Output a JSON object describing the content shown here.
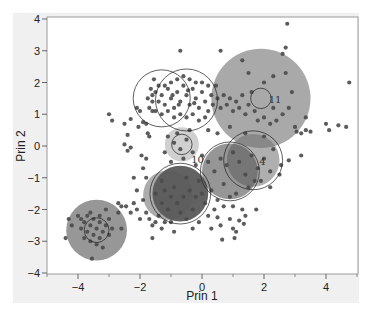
{
  "chart_data": {
    "type": "scatter",
    "title": "",
    "xlabel": "Prin 1",
    "ylabel": "Prin 2",
    "xlim": [
      -5,
      5.03
    ],
    "ylim": [
      -4,
      4.1
    ],
    "xticks": [
      -4,
      -2,
      0,
      2,
      4
    ],
    "yticks": [
      -4,
      -3,
      -2,
      -1,
      0,
      1,
      2,
      3,
      4
    ],
    "xminor": [
      -5,
      -3,
      -1,
      1,
      3,
      5
    ],
    "grid": false,
    "legend": null,
    "colors": {
      "background": "#ffffff",
      "panel": "#f0f0f0",
      "frame": "#9a9a9a",
      "point": "#4a4a4a",
      "shade_light": "#a8a8a8",
      "shade_mid": "#7a7a7a",
      "shade_dark": "#3c3c3c",
      "circle": "#222222"
    },
    "clusters": [
      {
        "id": "11",
        "cx": 1.9,
        "cy": 1.5,
        "shade_r": 1.6,
        "shade": "#9a9a9a",
        "shade_opacity": 0.85,
        "circle_r": 0.33,
        "label": "11",
        "label_dx": 0.25,
        "label_dy": -0.05
      },
      {
        "id": "A",
        "cx": -1.3,
        "cy": 1.5,
        "shade_r": 0.0,
        "shade": "#555555",
        "shade_opacity": 0.0,
        "circle_r": 0.92,
        "label": ""
      },
      {
        "id": "B",
        "cx": -0.5,
        "cy": 1.45,
        "shade_r": 0.0,
        "shade": "#555555",
        "shade_opacity": 0.0,
        "circle_r": 1.0,
        "label": ""
      },
      {
        "id": "C",
        "cx": -0.65,
        "cy": 0.05,
        "shade_r": 0.55,
        "shade": "#b0b0b0",
        "shade_opacity": 0.6,
        "circle_r": 0.33,
        "label": "10",
        "label_dx": 0.3,
        "label_dy": -0.5
      },
      {
        "id": "D",
        "cx": 1.65,
        "cy": -0.45,
        "shade_r": 0.85,
        "shade": "#6e6e6e",
        "shade_opacity": 0.55,
        "circle_r": 0.95,
        "label": "4",
        "label_dx": 0.2,
        "label_dy": -0.05
      },
      {
        "id": "E",
        "cx": 0.9,
        "cy": -0.8,
        "shade_r": 0.9,
        "shade": "#505050",
        "shade_opacity": 0.6,
        "circle_r": 0.95,
        "label": ""
      },
      {
        "id": "F",
        "cx": -0.7,
        "cy": -1.5,
        "shade_r": 0.9,
        "shade": "#2e2e2e",
        "shade_opacity": 0.75,
        "circle_r": 0.98,
        "label": ""
      },
      {
        "id": "G",
        "cx": -1.1,
        "cy": -1.55,
        "shade_r": 0.8,
        "shade": "#5a5a5a",
        "shade_opacity": 0.5,
        "circle_r": 0.0,
        "label": ""
      },
      {
        "id": "H",
        "cx": -3.4,
        "cy": -2.65,
        "shade_r": 0.98,
        "shade": "#8c8c8c",
        "shade_opacity": 0.9,
        "circle_r": 0.4,
        "label": ""
      }
    ],
    "points": [
      [
        -3.9,
        -2.3
      ],
      [
        -3.8,
        -2.4
      ],
      [
        -3.7,
        -2.2
      ],
      [
        -3.6,
        -2.5
      ],
      [
        -3.5,
        -2.3
      ],
      [
        -3.4,
        -2.6
      ],
      [
        -3.3,
        -2.4
      ],
      [
        -3.2,
        -2.7
      ],
      [
        -3.1,
        -2.5
      ],
      [
        -3.0,
        -2.3
      ],
      [
        -3.5,
        -2.8
      ],
      [
        -3.6,
        -3.0
      ],
      [
        -3.3,
        -2.9
      ],
      [
        -3.4,
        -3.1
      ],
      [
        -3.2,
        -3.2
      ],
      [
        -3.7,
        -2.7
      ],
      [
        -3.9,
        -2.6
      ],
      [
        -4.0,
        -2.2
      ],
      [
        -4.3,
        -2.3
      ],
      [
        -4.2,
        -2.5
      ],
      [
        -4.4,
        -2.9
      ],
      [
        -3.55,
        -3.55
      ],
      [
        -3.1,
        -2.0
      ],
      [
        -2.9,
        -2.6
      ],
      [
        -2.6,
        -2.6
      ],
      [
        -2.7,
        -2.1
      ],
      [
        -3.8,
        -2.9
      ],
      [
        -3.0,
        -2.8
      ],
      [
        -3.3,
        -2.2
      ],
      [
        -3.6,
        -2.1
      ],
      [
        -2.7,
        -1.8
      ],
      [
        -2.6,
        -1.9
      ],
      [
        -2.45,
        -1.9
      ],
      [
        -2.3,
        -2.1
      ],
      [
        -2.2,
        -1.8
      ],
      [
        -2.1,
        -2.0
      ],
      [
        -2.0,
        -2.3
      ],
      [
        -1.9,
        -1.7
      ],
      [
        -1.8,
        -2.1
      ],
      [
        -1.7,
        -2.3
      ],
      [
        -1.6,
        -2.5
      ],
      [
        -1.5,
        -2.4
      ],
      [
        -1.4,
        -2.2
      ],
      [
        -1.3,
        -2.6
      ],
      [
        -1.2,
        -2.4
      ],
      [
        -1.0,
        -2.4
      ],
      [
        -0.9,
        -2.7
      ],
      [
        -1.6,
        -2.9
      ],
      [
        -2.1,
        -1.4
      ],
      [
        -2.2,
        -1.0
      ],
      [
        -3.0,
        1.0
      ],
      [
        -2.9,
        0.8
      ],
      [
        -2.5,
        0.7
      ],
      [
        -2.3,
        0.85
      ],
      [
        -2.4,
        0.35
      ],
      [
        -2.5,
        0.05
      ],
      [
        -2.4,
        -0.15
      ],
      [
        -2.3,
        -0.05
      ],
      [
        -2.1,
        1.2
      ],
      [
        -2.0,
        1.1
      ],
      [
        -1.9,
        0.75
      ],
      [
        -1.8,
        0.7
      ],
      [
        -1.75,
        0.4
      ],
      [
        -1.7,
        0.3
      ],
      [
        -1.8,
        -0.4
      ],
      [
        -1.9,
        -0.7
      ],
      [
        -1.8,
        -1.0
      ],
      [
        -1.95,
        -0.3
      ],
      [
        -2.05,
        0.6
      ],
      [
        -1.6,
        1.1
      ],
      [
        -1.6,
        1.4
      ],
      [
        -1.5,
        1.7
      ],
      [
        -1.4,
        1.9
      ],
      [
        -1.3,
        1.6
      ],
      [
        -1.2,
        1.3
      ],
      [
        -1.1,
        1.8
      ],
      [
        -1.0,
        1.5
      ],
      [
        -0.9,
        1.2
      ],
      [
        -0.8,
        1.7
      ],
      [
        -0.7,
        1.4
      ],
      [
        -0.6,
        1.9
      ],
      [
        -0.5,
        1.6
      ],
      [
        -0.4,
        1.3
      ],
      [
        -0.3,
        1.8
      ],
      [
        -0.2,
        1.5
      ],
      [
        -0.1,
        1.2
      ],
      [
        0.0,
        1.7
      ],
      [
        0.1,
        1.4
      ],
      [
        0.2,
        1.1
      ],
      [
        0.3,
        1.6
      ],
      [
        -1.7,
        1.2
      ],
      [
        -1.5,
        1.1
      ],
      [
        -1.3,
        1.0
      ],
      [
        -1.1,
        1.1
      ],
      [
        -0.9,
        0.9
      ],
      [
        -0.7,
        1.0
      ],
      [
        -0.5,
        0.9
      ],
      [
        -0.3,
        1.0
      ],
      [
        -0.1,
        0.8
      ],
      [
        0.1,
        0.9
      ],
      [
        -1.6,
        1.6
      ],
      [
        -1.4,
        1.4
      ],
      [
        -1.2,
        1.9
      ],
      [
        -1.0,
        2.0
      ],
      [
        -0.8,
        2.1
      ],
      [
        -0.6,
        2.2
      ],
      [
        -0.4,
        2.1
      ],
      [
        -0.2,
        2.0
      ],
      [
        0.0,
        2.0
      ],
      [
        0.2,
        1.9
      ],
      [
        -1.55,
        2.1
      ],
      [
        -1.75,
        1.5
      ],
      [
        -1.65,
        1.8
      ],
      [
        -0.95,
        1.6
      ],
      [
        -0.75,
        1.3
      ],
      [
        -0.45,
        1.75
      ],
      [
        -0.25,
        1.35
      ],
      [
        0.35,
        1.3
      ],
      [
        0.45,
        1.9
      ],
      [
        0.5,
        1.5
      ],
      [
        0.6,
        1.2
      ],
      [
        0.7,
        1.6
      ],
      [
        0.8,
        1.3
      ],
      [
        0.9,
        1.5
      ],
      [
        1.0,
        1.1
      ],
      [
        1.1,
        1.4
      ],
      [
        1.2,
        1.2
      ],
      [
        1.3,
        1.6
      ],
      [
        1.4,
        1.0
      ],
      [
        1.5,
        1.3
      ],
      [
        1.6,
        1.7
      ],
      [
        1.7,
        1.1
      ],
      [
        1.8,
        0.8
      ],
      [
        2.0,
        0.9
      ],
      [
        2.2,
        0.7
      ],
      [
        2.4,
        0.8
      ],
      [
        2.6,
        1.0
      ],
      [
        2.3,
        1.2
      ],
      [
        2.0,
        2.0
      ],
      [
        1.5,
        2.3
      ],
      [
        2.3,
        2.2
      ],
      [
        2.7,
        2.3
      ],
      [
        2.8,
        1.2
      ],
      [
        2.9,
        1.7
      ],
      [
        1.3,
        2.7
      ],
      [
        0.6,
        3.0
      ],
      [
        -0.7,
        3.0
      ],
      [
        2.6,
        2.9
      ],
      [
        2.7,
        3.1
      ],
      [
        2.75,
        3.85
      ],
      [
        3.05,
        0.45
      ],
      [
        3.2,
        0.4
      ],
      [
        3.35,
        0.5
      ],
      [
        3.5,
        0.45
      ],
      [
        3.0,
        0.6
      ],
      [
        4.0,
        0.7
      ],
      [
        4.1,
        0.5
      ],
      [
        4.4,
        0.65
      ],
      [
        4.65,
        0.6
      ],
      [
        4.75,
        2.0
      ],
      [
        3.35,
        0.9
      ],
      [
        2.8,
        -0.45
      ],
      [
        3.2,
        -0.3
      ],
      [
        2.55,
        -0.6
      ],
      [
        2.3,
        -0.1
      ],
      [
        2.0,
        0.3
      ],
      [
        1.4,
        0.4
      ],
      [
        0.9,
        0.6
      ],
      [
        0.5,
        0.4
      ],
      [
        0.2,
        0.5
      ],
      [
        -1.1,
        0.3
      ],
      [
        -0.9,
        0.1
      ],
      [
        -0.7,
        -0.1
      ],
      [
        -0.5,
        0.2
      ],
      [
        -0.3,
        -0.2
      ],
      [
        -1.2,
        -0.2
      ],
      [
        -0.8,
        0.4
      ],
      [
        -0.4,
        0.5
      ],
      [
        -1.0,
        -0.5
      ],
      [
        -0.6,
        -0.4
      ],
      [
        -0.2,
        -0.6
      ],
      [
        0.0,
        -0.3
      ],
      [
        0.2,
        -0.5
      ],
      [
        0.4,
        -0.8
      ],
      [
        0.6,
        -0.4
      ],
      [
        0.8,
        -0.6
      ],
      [
        1.0,
        -0.2
      ],
      [
        1.2,
        -0.5
      ],
      [
        1.4,
        -0.9
      ],
      [
        1.6,
        -0.3
      ],
      [
        1.8,
        -0.7
      ],
      [
        2.0,
        -0.4
      ],
      [
        2.2,
        -0.8
      ],
      [
        1.9,
        -1.1
      ],
      [
        1.5,
        -1.3
      ],
      [
        1.1,
        -1.5
      ],
      [
        0.7,
        -1.2
      ],
      [
        0.3,
        -1.4
      ],
      [
        -0.1,
        -1.1
      ],
      [
        -0.5,
        -1.0
      ],
      [
        -0.9,
        -1.3
      ],
      [
        -1.3,
        -1.1
      ],
      [
        -1.5,
        -1.5
      ],
      [
        -1.3,
        -1.8
      ],
      [
        -1.1,
        -2.0
      ],
      [
        -0.7,
        -2.1
      ],
      [
        -0.3,
        -2.0
      ],
      [
        0.1,
        -1.8
      ],
      [
        0.5,
        -1.7
      ],
      [
        0.9,
        -1.6
      ],
      [
        -0.6,
        -1.6
      ],
      [
        -0.8,
        -1.8
      ],
      [
        -0.4,
        -1.4
      ],
      [
        -0.2,
        -1.6
      ],
      [
        -1.0,
        -1.6
      ],
      [
        -1.2,
        -1.4
      ],
      [
        0.0,
        -1.5
      ],
      [
        0.4,
        -2.0
      ],
      [
        0.2,
        -2.2
      ],
      [
        -0.5,
        -2.3
      ],
      [
        0.5,
        -2.25
      ],
      [
        0.6,
        -2.5
      ],
      [
        0.9,
        -2.3
      ],
      [
        1.0,
        -2.6
      ],
      [
        1.1,
        -2.7
      ],
      [
        1.2,
        -2.35
      ],
      [
        1.35,
        -2.45
      ],
      [
        1.4,
        -2.2
      ],
      [
        1.3,
        -2.0
      ],
      [
        1.75,
        -2.0
      ],
      [
        0.65,
        -2.95
      ],
      [
        1.05,
        -2.9
      ],
      [
        0.3,
        -2.6
      ],
      [
        -0.1,
        -2.4
      ],
      [
        -0.3,
        -2.6
      ],
      [
        1.7,
        -1.1
      ],
      [
        2.2,
        -1.3
      ],
      [
        1.0,
        -1.9
      ],
      [
        0.7,
        -1.9
      ],
      [
        2.5,
        -0.9
      ]
    ]
  }
}
